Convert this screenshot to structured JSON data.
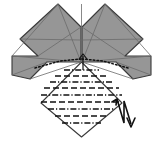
{
  "figure": {
    "kind": "origami-folding-diagram",
    "canvas": {
      "width": 163,
      "height": 144,
      "background": "#ffffff"
    }
  },
  "colors": {
    "paper_front": "#969696",
    "paper_back": "#ffffff",
    "outline": "#3a3a3a",
    "crease_line": "#555555",
    "fold_line": "#111111",
    "arrow": "#111111"
  },
  "shapes": {
    "left_wing": {
      "name": "left-wing-flap",
      "fill": "#969696",
      "points": "58,4 81,27 81,62 47,62 30,79 12,75 12,56 38,56 20,39"
    },
    "right_wing": {
      "name": "right-wing-flap",
      "fill": "#969696",
      "points": "105,4 82,27 82,62 116,62 133,79 151,75 151,56 125,56 143,39"
    },
    "center_diamond": {
      "name": "center-diamond-panel",
      "fill": "#ffffff",
      "points": "81.5,62 122,103 81.5,137 41,103"
    }
  },
  "internal_creases": {
    "name": "internal-crease-lines",
    "color": "#6b6b6b",
    "segments": [
      "58,4 81,62",
      "58,4 12,56",
      "20,39 81,40",
      "38,56 81,27",
      "12,75 47,62",
      "30,79 81,62",
      "12,56 81,62",
      "105,4 82,62",
      "105,4 151,56",
      "143,39 82,40",
      "125,56 82,27",
      "151,75 116,62",
      "133,79 82,62",
      "151,56 82,62",
      "81.5,4 81.5,62"
    ]
  },
  "dotted_arc": {
    "name": "hidden-edge-dotted-line",
    "color": "#111111",
    "left": "35,68 60,61 81,59",
    "right": "128,68 103,61 82,59"
  },
  "fold_lines": [
    {
      "name": "pleat-line-1",
      "style": "dash-dot",
      "y": 70,
      "x1": 64,
      "x2": 99
    },
    {
      "name": "pleat-line-2",
      "style": "dashed",
      "y": 76,
      "x1": 55,
      "x2": 108
    },
    {
      "name": "pleat-line-3",
      "style": "dash-dot",
      "y": 82,
      "x1": 50,
      "x2": 113
    },
    {
      "name": "pleat-line-4",
      "style": "dashed",
      "y": 88,
      "x1": 44,
      "x2": 119
    },
    {
      "name": "pleat-line-5",
      "style": "dash-dot",
      "y": 95,
      "x1": 41,
      "x2": 122
    },
    {
      "name": "pleat-line-6",
      "style": "dashed",
      "y": 102,
      "x1": 41,
      "x2": 122
    },
    {
      "name": "pleat-line-7",
      "style": "dash-dot",
      "y": 109,
      "x1": 48,
      "x2": 115
    },
    {
      "name": "pleat-line-8",
      "style": "dashed",
      "y": 116,
      "x1": 55,
      "x2": 108
    },
    {
      "name": "pleat-line-9",
      "style": "dash-dot",
      "y": 123,
      "x1": 62,
      "x2": 101
    }
  ],
  "small_arrow": {
    "name": "small-fold-arrow",
    "color": "#111111",
    "shaft": "83,56 83,70",
    "head": "79,59 83,54 87,59"
  },
  "pleat_symbol": {
    "name": "pleat-fold-arrow-symbol",
    "color": "#111111",
    "zigzag": "117,99 124,123 124,101 131,124",
    "arrowhead": "127,118 131,127 135,118",
    "tail_barb": "112,102 117,99 116,105"
  },
  "legend": {
    "mountain_fold": "dash-dot",
    "valley_fold": "dashed",
    "hidden_edge": "dotted"
  }
}
